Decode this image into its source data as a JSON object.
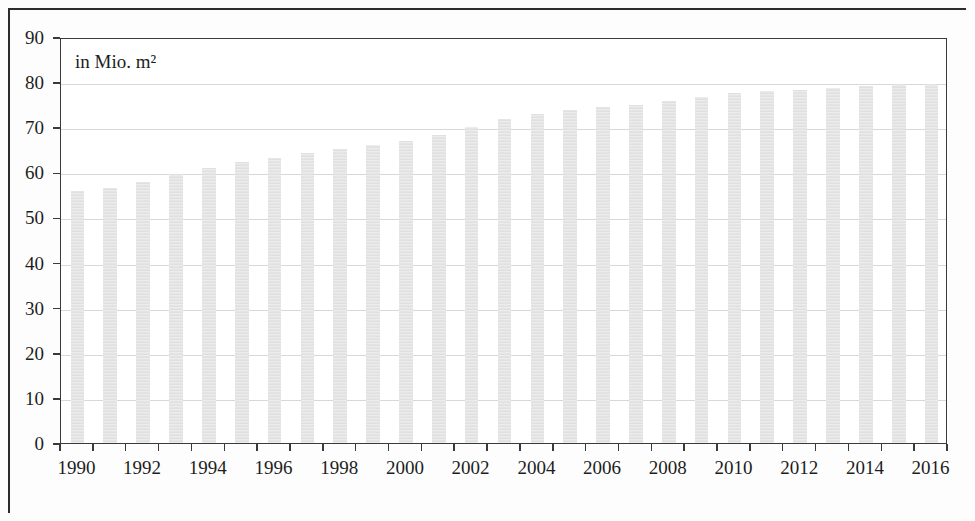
{
  "chart_data": {
    "type": "bar",
    "title": "",
    "subtitle": "",
    "unit_note": "in Mio. m²",
    "xlabel": "",
    "ylabel": "",
    "ylim": [
      0,
      90
    ],
    "ytick_step": 10,
    "grid": true,
    "legend": null,
    "bar_color": "#e6e6e6",
    "axis_color": "#3a3a3a",
    "grid_color": "#d8d8d8",
    "categories": [
      "1990",
      "1991",
      "1992",
      "1993",
      "1994",
      "1995",
      "1996",
      "1997",
      "1998",
      "1999",
      "2000",
      "2001",
      "2002",
      "2003",
      "2004",
      "2005",
      "2006",
      "2007",
      "2008",
      "2009",
      "2010",
      "2011",
      "2012",
      "2013",
      "2014",
      "2015",
      "2016"
    ],
    "values": [
      55.8,
      56.6,
      57.9,
      59.6,
      61.0,
      62.2,
      63.2,
      64.2,
      65.2,
      66.1,
      67.0,
      68.2,
      70.1,
      71.9,
      73.0,
      73.9,
      74.6,
      74.9,
      75.8,
      76.6,
      77.5,
      78.0,
      78.3,
      78.8,
      79.2,
      79.5,
      79.7
    ],
    "ytick_labels": [
      "90",
      "80",
      "70",
      "60",
      "50",
      "40",
      "30",
      "20",
      "10",
      "0"
    ],
    "ytick_values": [
      90,
      80,
      70,
      60,
      50,
      40,
      30,
      20,
      10,
      0
    ],
    "xtick_labels": [
      "1990",
      "1992",
      "1994",
      "1996",
      "1998",
      "2000",
      "2002",
      "2004",
      "2006",
      "2008",
      "2010",
      "2012",
      "2014",
      "2016"
    ],
    "xtick_label_values": [
      1990,
      1992,
      1994,
      1996,
      1998,
      2000,
      2002,
      2004,
      2006,
      2008,
      2010,
      2012,
      2014,
      2016
    ]
  }
}
